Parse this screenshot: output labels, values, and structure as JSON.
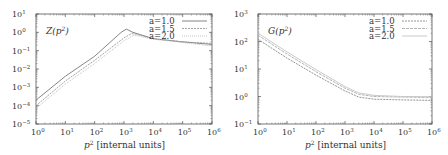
{
  "chart_data": [
    {
      "type": "line",
      "title": "Z(p²)",
      "xlabel": "p² [internal units]",
      "ylabel": "",
      "xscale": "log",
      "yscale": "log",
      "xlim": [
        1,
        1000000
      ],
      "ylim": [
        1e-05,
        10
      ],
      "xticks": [
        "10^0",
        "10^1",
        "10^2",
        "10^3",
        "10^4",
        "10^5",
        "10^6"
      ],
      "yticks": [
        "10^-5",
        "10^-4",
        "10^-3",
        "10^-2",
        "10^-1",
        "10^0",
        "10^1"
      ],
      "grid": false,
      "legend_position": "upper right",
      "series": [
        {
          "name": "a=1.0",
          "color": "#777777",
          "dash": "",
          "x": [
            1,
            10,
            100,
            800,
            1200,
            2000,
            10000,
            100000,
            1000000
          ],
          "y": [
            0.0002,
            0.004,
            0.05,
            1.0,
            1.5,
            1.0,
            0.45,
            0.3,
            0.22
          ]
        },
        {
          "name": "a=1.5",
          "color": "#999999",
          "dash": "2,1",
          "x": [
            1,
            10,
            100,
            1000,
            1800,
            2500,
            10000,
            100000,
            1000000
          ],
          "y": [
            0.0001,
            0.0022,
            0.03,
            0.5,
            0.85,
            0.8,
            0.45,
            0.3,
            0.25
          ]
        },
        {
          "name": "a=2.0",
          "color": "#bbbbbb",
          "dash": "1,1",
          "x": [
            1,
            10,
            100,
            1000,
            2200,
            3000,
            10000,
            100000,
            1000000
          ],
          "y": [
            7e-05,
            0.0015,
            0.02,
            0.35,
            0.7,
            0.65,
            0.42,
            0.28,
            0.18
          ]
        }
      ]
    },
    {
      "type": "line",
      "title": "G(p²)",
      "xlabel": "p² [internal units]",
      "ylabel": "",
      "xscale": "log",
      "yscale": "log",
      "xlim": [
        1,
        1000000
      ],
      "ylim": [
        0.1,
        1000
      ],
      "xticks": [
        "10^0",
        "10^1",
        "10^2",
        "10^3",
        "10^4",
        "10^5",
        "10^6"
      ],
      "yticks": [
        "10^-1",
        "10^0",
        "10^1",
        "10^2",
        "10^3"
      ],
      "grid": false,
      "legend_position": "upper right",
      "series": [
        {
          "name": "a=1.0",
          "color": "#888888",
          "dash": "2,1",
          "x": [
            1,
            10,
            100,
            1000,
            3000,
            10000,
            100000,
            1000000
          ],
          "y": [
            120,
            25,
            6,
            1.6,
            0.95,
            0.8,
            0.75,
            0.72
          ]
        },
        {
          "name": "a=1.5",
          "color": "#aaaaaa",
          "dash": "3,1",
          "x": [
            1,
            10,
            100,
            1000,
            3000,
            10000,
            100000,
            1000000
          ],
          "y": [
            170,
            35,
            8,
            2.0,
            1.2,
            1.0,
            0.95,
            0.92
          ]
        },
        {
          "name": "a=2.0",
          "color": "#c4c4c4",
          "dash": "",
          "x": [
            1,
            10,
            100,
            1000,
            3000,
            10000,
            100000,
            1000000
          ],
          "y": [
            200,
            42,
            9.5,
            2.3,
            1.35,
            1.1,
            1.0,
            0.98
          ]
        }
      ]
    }
  ],
  "panels": [
    {
      "title_main": "Z(p",
      "title_sup": "2",
      "title_end": ")",
      "xlabel_main": "p",
      "xlabel_sup": "2",
      "xlabel_rest": " [internal units]",
      "xtick_labels": [
        "0",
        "1",
        "2",
        "3",
        "4",
        "5",
        "6"
      ],
      "ytick_labels": [
        "−5",
        "−4",
        "−3",
        "−2",
        "−1",
        "0",
        "1"
      ],
      "legend": [
        "a=1.0",
        "a=1.5",
        "a=2.0"
      ]
    },
    {
      "title_main": "G(p",
      "title_sup": "2",
      "title_end": ")",
      "xlabel_main": "p",
      "xlabel_sup": "2",
      "xlabel_rest": " [internal units]",
      "xtick_labels": [
        "0",
        "1",
        "2",
        "3",
        "4",
        "5",
        "6"
      ],
      "ytick_labels": [
        "−1",
        "0",
        "1",
        "2",
        "3"
      ],
      "legend": [
        "a=1.0",
        "a=1.5",
        "a=2.0"
      ]
    }
  ],
  "tick_base": "10"
}
